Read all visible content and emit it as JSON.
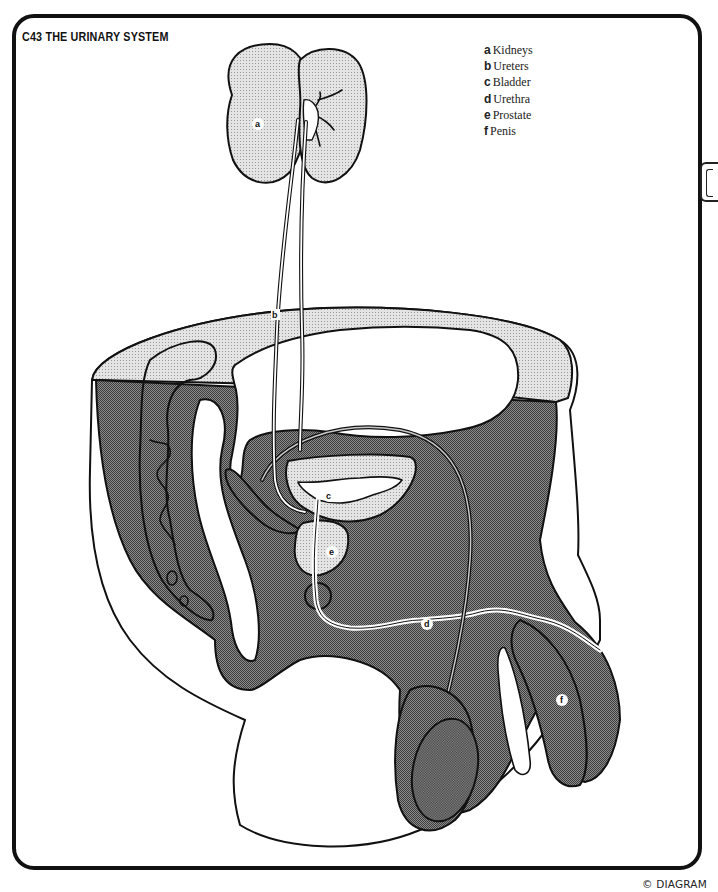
{
  "header": {
    "title": "C43 THE URINARY SYSTEM"
  },
  "legend": {
    "items": [
      {
        "key": "a",
        "label": "Kidneys"
      },
      {
        "key": "b",
        "label": "Ureters"
      },
      {
        "key": "c",
        "label": "Bladder"
      },
      {
        "key": "d",
        "label": "Urethra"
      },
      {
        "key": "e",
        "label": "Prostate"
      },
      {
        "key": "f",
        "label": "Penis"
      }
    ]
  },
  "diagram": {
    "labels": {
      "a": "a",
      "b": "b",
      "c": "c",
      "d": "d",
      "e": "e",
      "f": "f"
    },
    "colors": {
      "outline": "#111111",
      "light_stipple": "#d9d9d9",
      "dark_stipple": "#7a7a7a",
      "background": "#ffffff"
    }
  },
  "footer": {
    "copyright": "© DIAGRAM"
  }
}
